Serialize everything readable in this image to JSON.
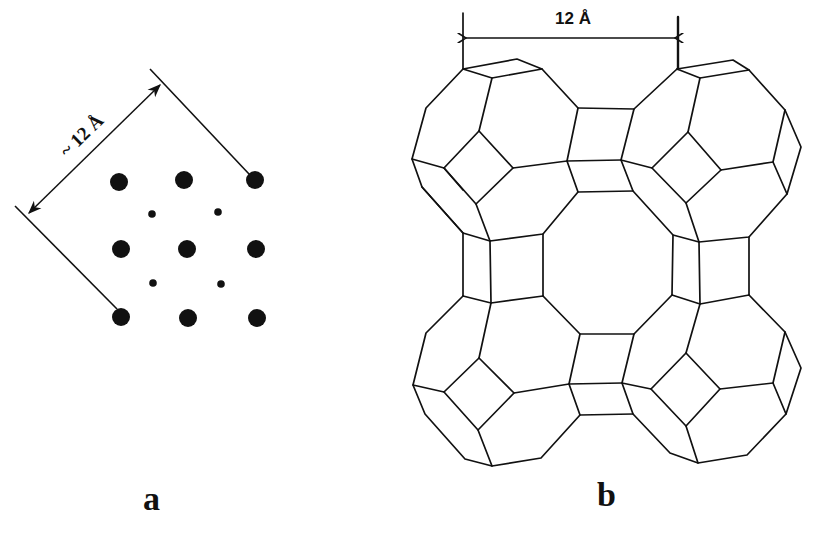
{
  "figure": {
    "panels": [
      {
        "id": "a",
        "label": "a",
        "dimension_label": "~ 12 Å",
        "description": "Square lattice projection of pore openings",
        "dots": {
          "large": [
            [
              119,
              182
            ],
            [
              184,
              180
            ],
            [
              255,
              180
            ],
            [
              121,
              249
            ],
            [
              187,
              249
            ],
            [
              256,
              249
            ],
            [
              121,
              317
            ],
            [
              188,
              318
            ],
            [
              257,
              318
            ]
          ],
          "small": [
            [
              152,
              214
            ],
            [
              218,
              212
            ],
            [
              153,
              283
            ],
            [
              221,
              284
            ]
          ]
        }
      },
      {
        "id": "b",
        "label": "b",
        "dimension_label": "12 Å",
        "description": "Sodalite cages linked by double 4-rings forming a central supercage"
      }
    ]
  },
  "colors": {
    "line": "#111111",
    "background": "#ffffff"
  }
}
